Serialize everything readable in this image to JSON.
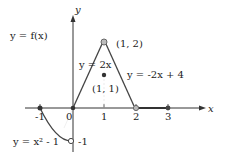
{
  "graph": {
    "title_label": "y = f(x)",
    "axis_labels": {
      "x": "x",
      "y": "y"
    },
    "x_ticks": [
      {
        "value": -1,
        "label": "-1"
      },
      {
        "value": 0,
        "label": "0"
      },
      {
        "value": 1,
        "label": "1"
      },
      {
        "value": 2,
        "label": "2"
      },
      {
        "value": 3,
        "label": "3"
      }
    ],
    "y_ticks": [
      {
        "value": -1,
        "label": "-1"
      }
    ],
    "pieces": [
      {
        "name": "parabola",
        "label": "y = x² - 1",
        "domain": "[-1, 0)"
      },
      {
        "name": "rising-line",
        "label": "y = 2x",
        "domain": "[0, 1)"
      },
      {
        "name": "falling-line",
        "label": "y = -2x + 4",
        "domain": "(1, 2)"
      },
      {
        "name": "zero-line",
        "label": "y = 0",
        "domain": "[2, 3]"
      }
    ],
    "point_labels": {
      "peak": "(1, 2)",
      "isolated": "(1, 1)"
    },
    "points": [
      {
        "x": -1,
        "y": 0,
        "type": "closed"
      },
      {
        "x": 0,
        "y": -1,
        "type": "open"
      },
      {
        "x": 0,
        "y": 0,
        "type": "closed"
      },
      {
        "x": 1,
        "y": 2,
        "type": "open"
      },
      {
        "x": 1,
        "y": 1,
        "type": "closed"
      },
      {
        "x": 2,
        "y": 0,
        "type": "open"
      },
      {
        "x": 3,
        "y": 0,
        "type": "closed"
      }
    ],
    "colors": {
      "axis": "#333333",
      "curve": "#555555",
      "open_fill": "#bbbbbb",
      "text": "#222222"
    }
  }
}
